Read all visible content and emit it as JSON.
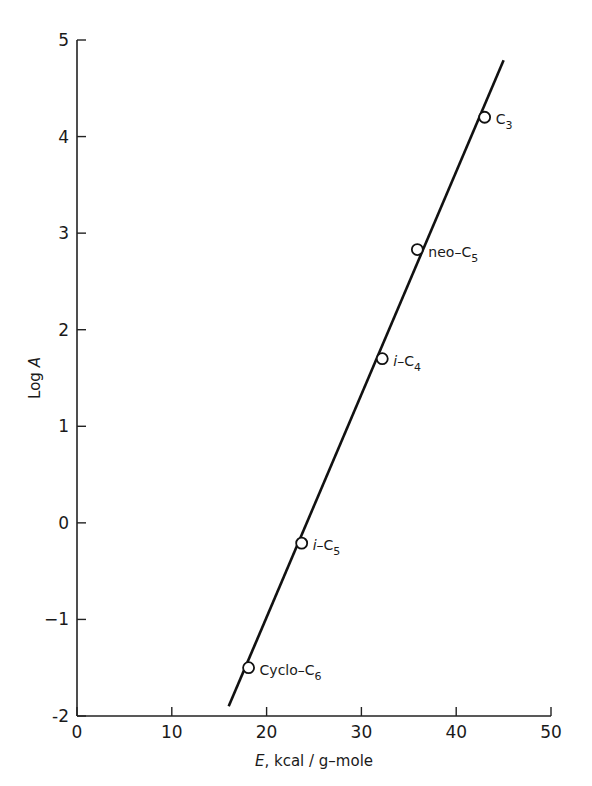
{
  "chart_data": {
    "type": "scatter",
    "title": "",
    "xlabel": "E, kcal/g-mole",
    "xlabel_var": "E",
    "xlabel_unit": ", kcal / g–mole",
    "ylabel": "Log A",
    "ylabel_prefix": "Log ",
    "ylabel_var": "A",
    "xlim": [
      0,
      50
    ],
    "ylim": [
      -2,
      5
    ],
    "xticks": [
      0,
      10,
      20,
      30,
      40,
      50
    ],
    "yticks": [
      -2,
      -1,
      0,
      1,
      2,
      3,
      4,
      5
    ],
    "xtick_labels": [
      "0",
      "10",
      "20",
      "30",
      "40",
      "50"
    ],
    "ytick_labels": [
      "-2",
      "−1",
      "0",
      "1",
      "2",
      "3",
      "4",
      "5"
    ],
    "grid": false,
    "legend": null,
    "points": [
      {
        "name": "C3",
        "label_main": "C",
        "label_sub": "3",
        "label_prefix": "",
        "x": 43.0,
        "y": 4.2
      },
      {
        "name": "neo-C5",
        "label_main": "neo–C",
        "label_sub": "5",
        "label_prefix": "",
        "x": 35.9,
        "y": 2.83
      },
      {
        "name": "i-C4",
        "label_main": "–C",
        "label_sub": "4",
        "label_prefix": "i",
        "x": 32.2,
        "y": 1.7
      },
      {
        "name": "i-C5",
        "label_main": "–C",
        "label_sub": "5",
        "label_prefix": "i",
        "x": 23.7,
        "y": -0.21
      },
      {
        "name": "Cyclo-C6",
        "label_main": "Cyclo–C",
        "label_sub": "6",
        "label_prefix": "",
        "x": 18.1,
        "y": -1.5
      }
    ],
    "fit_line": {
      "x": [
        16.0,
        45.0
      ],
      "y": [
        -1.9,
        4.79
      ]
    }
  }
}
